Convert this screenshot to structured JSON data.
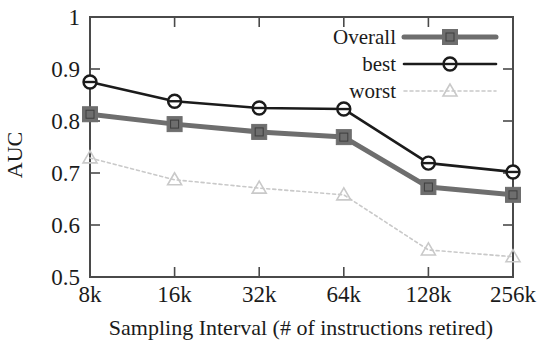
{
  "chart_data": {
    "type": "line",
    "title": "",
    "xlabel": "Sampling Interval (# of instructions retired)",
    "ylabel": "AUC",
    "categories": [
      "8k",
      "16k",
      "32k",
      "64k",
      "128k",
      "256k"
    ],
    "x_tick_labels": [
      "8k",
      "16k",
      "32k",
      "64k",
      "128k",
      "256k"
    ],
    "y_tick_labels": [
      "0.5",
      "0.6",
      "0.7",
      "0.8",
      "0.9",
      "1"
    ],
    "y_tick_values": [
      0.5,
      0.6,
      0.7,
      0.8,
      0.9,
      1.0
    ],
    "ylim": [
      0.5,
      1.0
    ],
    "grid": false,
    "legend_position": "top-right",
    "series": [
      {
        "name": "Overall",
        "values": [
          0.813,
          0.794,
          0.779,
          0.769,
          0.673,
          0.658
        ],
        "color": "#6e6e6e",
        "marker": "square",
        "linestyle": "solid",
        "linewidth": 5
      },
      {
        "name": "best",
        "values": [
          0.875,
          0.838,
          0.825,
          0.823,
          0.719,
          0.702
        ],
        "color": "#1b1b1b",
        "marker": "circle",
        "linestyle": "solid",
        "linewidth": 2.6
      },
      {
        "name": "worst",
        "values": [
          0.729,
          0.687,
          0.671,
          0.658,
          0.552,
          0.539
        ],
        "color": "#c9c9c9",
        "marker": "triangle",
        "linestyle": "dotted",
        "linewidth": 1.6
      }
    ]
  },
  "legend": {
    "entries": [
      {
        "label": "Overall"
      },
      {
        "label": "best"
      },
      {
        "label": "worst"
      }
    ]
  },
  "axes": {
    "y_label": "AUC",
    "x_label": "Sampling Interval (# of instructions retired)"
  }
}
